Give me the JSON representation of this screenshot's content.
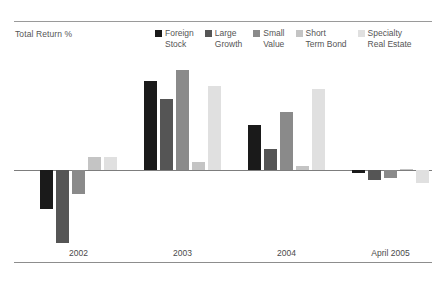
{
  "axis_title": "Total Return %",
  "legend": {
    "items": [
      {
        "line1": "Foreign",
        "line2": "Stock",
        "color": "#1a1a1a"
      },
      {
        "line1": "Large",
        "line2": "Growth",
        "color": "#555555"
      },
      {
        "line1": "Small",
        "line2": "Value",
        "color": "#8a8a8a"
      },
      {
        "line1": "Short",
        "line2": "Term Bond",
        "color": "#c4c4c4"
      },
      {
        "line1": "Specialty",
        "line2": "Real Estate",
        "color": "#e0e0e0"
      }
    ]
  },
  "chart_data": {
    "type": "bar",
    "title": "",
    "subtitle": "",
    "xlabel": "",
    "ylabel": "Total Return %",
    "categories": [
      "2002",
      "2003",
      "2004",
      "April 2005"
    ],
    "series": [
      {
        "name": "Foreign Stock",
        "color": "#1a1a1a",
        "values": [
          -15,
          34,
          17,
          -1
        ]
      },
      {
        "name": "Large Growth",
        "color": "#555555",
        "values": [
          -28,
          27,
          8,
          -4
        ]
      },
      {
        "name": "Small Value",
        "color": "#8a8a8a",
        "values": [
          -9,
          38,
          22,
          -3
        ]
      },
      {
        "name": "Short Term Bond",
        "color": "#c4c4c4",
        "values": [
          5,
          3,
          1.5,
          0.5
        ]
      },
      {
        "name": "Specialty Real Estate",
        "color": "#e0e0e0",
        "values": [
          5,
          32,
          31,
          -5
        ]
      }
    ],
    "ylim": [
      -30,
      42
    ],
    "zero_line": 0,
    "grid": false,
    "legend_position": "top"
  }
}
